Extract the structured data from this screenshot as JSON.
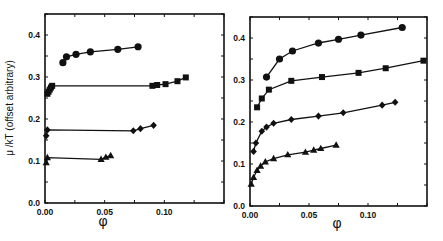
{
  "chart_data": [
    {
      "type": "line",
      "panel": "left",
      "title": "",
      "xlabel": "φ",
      "ylabel": "μ /kT (offset arbitrary)",
      "xlim": [
        0.0,
        0.15
      ],
      "ylim": [
        0.0,
        0.45
      ],
      "xticks": [
        "0.00",
        "0.05",
        "0.10"
      ],
      "yticks": [
        "0.0",
        "0.1",
        "0.2",
        "0.3",
        "0.4"
      ],
      "grid": false,
      "legend": null,
      "series": [
        {
          "name": "circles",
          "marker": "circle",
          "x": [
            0.015,
            0.018,
            0.026,
            0.038,
            0.061,
            0.078
          ],
          "y": [
            0.334,
            0.348,
            0.354,
            0.36,
            0.366,
            0.372
          ]
        },
        {
          "name": "squares",
          "marker": "square",
          "x": [
            0.002,
            0.003,
            0.004,
            0.005,
            0.006,
            0.09,
            0.094,
            0.101,
            0.111,
            0.118
          ],
          "y": [
            0.26,
            0.265,
            0.27,
            0.275,
            0.279,
            0.279,
            0.281,
            0.283,
            0.29,
            0.299
          ]
        },
        {
          "name": "diamonds",
          "marker": "diamond",
          "x": [
            0.001,
            0.002,
            0.074,
            0.08,
            0.091
          ],
          "y": [
            0.16,
            0.174,
            0.172,
            0.177,
            0.185
          ]
        },
        {
          "name": "triangles",
          "marker": "triangle",
          "x": [
            0.001,
            0.002,
            0.047,
            0.051,
            0.055
          ],
          "y": [
            0.096,
            0.108,
            0.104,
            0.109,
            0.113
          ]
        }
      ]
    },
    {
      "type": "line",
      "panel": "right",
      "title": "",
      "xlabel": "φ",
      "ylabel": "",
      "xlim": [
        0.0,
        0.15
      ],
      "ylim": [
        0.0,
        0.45
      ],
      "xticks": [
        "0.00",
        "0.05",
        "0.10"
      ],
      "yticks": [
        "0.0",
        "0.1",
        "0.2",
        "0.3",
        "0.4"
      ],
      "grid": false,
      "legend": null,
      "series": [
        {
          "name": "circles",
          "marker": "circle",
          "x": [
            0.014,
            0.025,
            0.036,
            0.058,
            0.075,
            0.094,
            0.129
          ],
          "y": [
            0.307,
            0.35,
            0.369,
            0.388,
            0.397,
            0.407,
            0.425
          ]
        },
        {
          "name": "squares",
          "marker": "square",
          "x": [
            0.006,
            0.01,
            0.016,
            0.035,
            0.061,
            0.092,
            0.115,
            0.147
          ],
          "y": [
            0.235,
            0.256,
            0.277,
            0.298,
            0.307,
            0.317,
            0.328,
            0.346
          ]
        },
        {
          "name": "diamonds",
          "marker": "diamond",
          "x": [
            0.003,
            0.005,
            0.01,
            0.014,
            0.02,
            0.035,
            0.058,
            0.079,
            0.112,
            0.123
          ],
          "y": [
            0.13,
            0.15,
            0.178,
            0.188,
            0.197,
            0.206,
            0.214,
            0.222,
            0.24,
            0.247
          ]
        },
        {
          "name": "triangles",
          "marker": "triangle",
          "x": [
            0.001,
            0.003,
            0.006,
            0.009,
            0.013,
            0.02,
            0.032,
            0.047,
            0.054,
            0.06,
            0.073
          ],
          "y": [
            0.052,
            0.068,
            0.085,
            0.095,
            0.105,
            0.113,
            0.122,
            0.128,
            0.133,
            0.137,
            0.145
          ]
        }
      ]
    }
  ],
  "panels": {
    "left": {
      "ylabel": "μ /kT (offset arbitrary)",
      "xlabel": "φ"
    },
    "right": {
      "xlabel": "φ"
    }
  }
}
